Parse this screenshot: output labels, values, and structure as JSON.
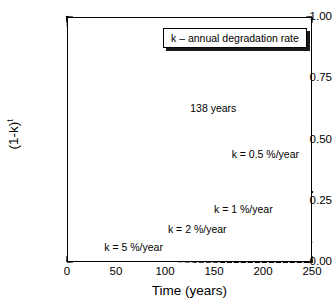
{
  "chart_data": {
    "type": "line",
    "title": "",
    "xlabel": "Time (years)",
    "ylabel": "(1-k)",
    "ylabel_superscript": "t",
    "xlim": [
      0,
      250
    ],
    "ylim": [
      0.0,
      1.0
    ],
    "grid": false,
    "legend_position": "top-right",
    "legend_title": "k – annual degradation rate",
    "xticks": [
      "0",
      "50",
      "100",
      "150",
      "200",
      "250"
    ],
    "xtick_values": [
      0,
      50,
      100,
      150,
      200,
      250
    ],
    "xminor_step": 10,
    "yticks": [
      "0.00",
      "0.25",
      "0.50",
      "0.75",
      "1.00"
    ],
    "ytick_values": [
      0.0,
      0.25,
      0.5,
      0.75,
      1.0
    ],
    "yminor_step": 0.05,
    "reference_line": {
      "axis": "y",
      "value": 0.5,
      "style": "dotted",
      "label": ""
    },
    "annotations": [
      {
        "text": "138 years",
        "x": 138,
        "y": 0.5,
        "arrow": "down",
        "description": "half-life marker for k = 0.5 %/year curve"
      }
    ],
    "x": [
      0,
      10,
      20,
      30,
      40,
      50,
      60,
      70,
      80,
      90,
      100,
      110,
      120,
      130,
      140,
      150,
      160,
      170,
      180,
      190,
      200,
      210,
      220,
      230,
      240,
      250
    ],
    "series": [
      {
        "name": "k = 0.5 %/year",
        "k_percent": 0.5,
        "style": "solid",
        "linewidth": "thick",
        "color": "#000000",
        "label_x": 168,
        "label_y": 0.44,
        "values": [
          1.0,
          0.951,
          0.904,
          0.86,
          0.818,
          0.778,
          0.74,
          0.704,
          0.669,
          0.636,
          0.605,
          0.576,
          0.548,
          0.521,
          0.495,
          0.471,
          0.448,
          0.426,
          0.405,
          0.385,
          0.366,
          0.348,
          0.331,
          0.315,
          0.3,
          0.285
        ]
      },
      {
        "name": "k = 1 %/year",
        "k_percent": 1,
        "style": "solid",
        "linewidth": "thin",
        "color": "#000000",
        "label_x": 150,
        "label_y": 0.215,
        "values": [
          1.0,
          0.904,
          0.818,
          0.74,
          0.669,
          0.605,
          0.547,
          0.495,
          0.448,
          0.405,
          0.366,
          0.331,
          0.299,
          0.271,
          0.245,
          0.221,
          0.2,
          0.181,
          0.164,
          0.148,
          0.134,
          0.121,
          0.11,
          0.099,
          0.09,
          0.081
        ]
      },
      {
        "name": "k = 2 %/year",
        "k_percent": 2,
        "style": "solid",
        "linewidth": "thin",
        "color": "#000000",
        "label_x": 103,
        "label_y": 0.135,
        "values": [
          1.0,
          0.817,
          0.668,
          0.545,
          0.446,
          0.364,
          0.298,
          0.243,
          0.199,
          0.162,
          0.133,
          0.108,
          0.089,
          0.072,
          0.059,
          0.048,
          0.039,
          0.032,
          0.026,
          0.021,
          0.018,
          0.014,
          0.012,
          0.01,
          0.008,
          0.006
        ]
      },
      {
        "name": "k = 5 %/year",
        "k_percent": 5,
        "style": "dashed",
        "linewidth": "medium",
        "color": "#000000",
        "label_x": 38,
        "label_y": 0.06,
        "values": [
          1.0,
          0.599,
          0.358,
          0.215,
          0.129,
          0.077,
          0.046,
          0.028,
          0.017,
          0.01,
          0.006,
          0.0035,
          0.0021,
          0.0013,
          0.0008,
          0.0005,
          0.0003,
          0.0002,
          0.0001,
          0.0001,
          0.0,
          0.0,
          0.0,
          0.0,
          0.0,
          0.0
        ]
      }
    ]
  },
  "colors": {
    "axis": "#000000",
    "background": "#ffffff",
    "reference_line": "#555555",
    "legend_shadow": "#1a1a1a"
  }
}
